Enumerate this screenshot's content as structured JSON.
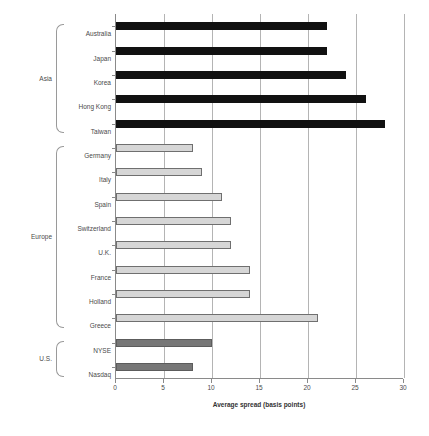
{
  "chart_data": {
    "type": "bar",
    "orientation": "horizontal",
    "title": "",
    "xlabel": "Average spread (basis points)",
    "ylabel": "",
    "xlim": [
      0,
      30
    ],
    "xticks": [
      0,
      5,
      10,
      15,
      20,
      25,
      30
    ],
    "grid": "vertical",
    "legend": "none",
    "categories": [
      "Australia",
      "Japan",
      "Korea",
      "Hong Kong",
      "Taiwan",
      "Germany",
      "Italy",
      "Spain",
      "Switzerland",
      "U.K.",
      "France",
      "Holland",
      "Greece",
      "NYSE",
      "Nasdaq"
    ],
    "values": [
      22,
      22,
      24,
      26,
      28,
      8,
      9,
      11,
      12,
      12,
      14,
      14,
      21,
      10,
      8
    ],
    "groups": [
      {
        "name": "Asia",
        "members": [
          "Australia",
          "Japan",
          "Korea",
          "Hong Kong",
          "Taiwan"
        ],
        "color": "#111111"
      },
      {
        "name": "Europe",
        "members": [
          "Germany",
          "Italy",
          "Spain",
          "Switzerland",
          "U.K.",
          "France",
          "Holland",
          "Greece"
        ],
        "color": "#d6d6d6"
      },
      {
        "name": "U.S.",
        "members": [
          "NYSE",
          "Nasdaq"
        ],
        "color": "#777777"
      }
    ],
    "series": [
      {
        "name": "Average spread",
        "points": [
          {
            "category": "Australia",
            "value": 22,
            "group": "Asia"
          },
          {
            "category": "Japan",
            "value": 22,
            "group": "Asia"
          },
          {
            "category": "Korea",
            "value": 24,
            "group": "Asia"
          },
          {
            "category": "Hong Kong",
            "value": 26,
            "group": "Asia"
          },
          {
            "category": "Taiwan",
            "value": 28,
            "group": "Asia"
          },
          {
            "category": "Germany",
            "value": 8,
            "group": "Europe"
          },
          {
            "category": "Italy",
            "value": 9,
            "group": "Europe"
          },
          {
            "category": "Spain",
            "value": 11,
            "group": "Europe"
          },
          {
            "category": "Switzerland",
            "value": 12,
            "group": "Europe"
          },
          {
            "category": "U.K.",
            "value": 12,
            "group": "Europe"
          },
          {
            "category": "France",
            "value": 14,
            "group": "Europe"
          },
          {
            "category": "Holland",
            "value": 14,
            "group": "Europe"
          },
          {
            "category": "Greece",
            "value": 21,
            "group": "Europe"
          },
          {
            "category": "NYSE",
            "value": 10,
            "group": "U.S."
          },
          {
            "category": "Nasdaq",
            "value": 8,
            "group": "U.S."
          }
        ]
      }
    ],
    "colors": {
      "asia_bar": "#111111",
      "europe_bar": "#d6d6d6",
      "europe_bar_border": "#6f6f6f",
      "us_bar": "#777777",
      "gridline": "#b4b4b4",
      "axis": "#8a8a8a",
      "text": "#4a4a4a",
      "background": "#ffffff"
    }
  }
}
